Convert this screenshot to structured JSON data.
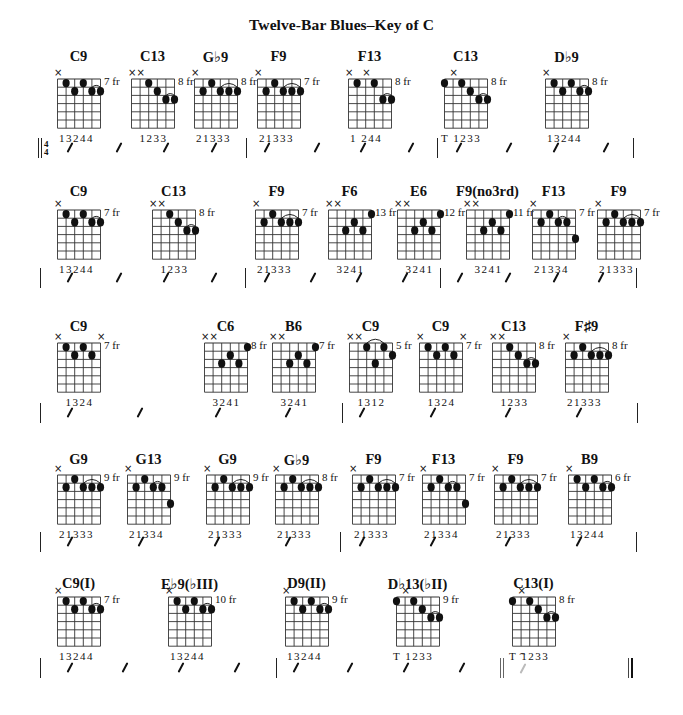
{
  "title": "Twelve-Bar Blues–Key of C",
  "time_signature": {
    "top": "4",
    "bottom": "4"
  },
  "fermata_symbol": "⌢",
  "rows": [
    {
      "chords": [
        {
          "name": "C9",
          "fret": "7 fr",
          "muted": [
            0
          ],
          "dots": [
            [
              1,
              1
            ],
            [
              2,
              2
            ],
            [
              3,
              1
            ],
            [
              4,
              2
            ],
            [
              5,
              2
            ]
          ],
          "barres": [
            [
              4,
              5
            ]
          ],
          "fingering": "13244"
        },
        {
          "name": "C13",
          "fret": "8 fr",
          "muted": [
            0,
            1
          ],
          "dots": [
            [
              2,
              1
            ],
            [
              3,
              2
            ],
            [
              4,
              3
            ],
            [
              5,
              3
            ]
          ],
          "barres": [
            [
              4,
              5
            ]
          ],
          "fingering": "1233"
        },
        {
          "name": "G♭9",
          "fret": "8 fr",
          "muted": [
            0
          ],
          "dots": [
            [
              1,
              2
            ],
            [
              2,
              1
            ],
            [
              3,
              2
            ],
            [
              4,
              2
            ],
            [
              5,
              2
            ]
          ],
          "barres": [
            [
              3,
              5
            ]
          ],
          "fingering": "21333"
        },
        {
          "name": "F9",
          "fret": "7 fr",
          "muted": [
            0
          ],
          "dots": [
            [
              1,
              2
            ],
            [
              2,
              1
            ],
            [
              3,
              2
            ],
            [
              4,
              2
            ],
            [
              5,
              2
            ]
          ],
          "barres": [
            [
              3,
              5
            ]
          ],
          "fingering": "21333"
        },
        {
          "name": "F13",
          "fret": "8 fr",
          "muted": [
            0,
            2
          ],
          "dots": [
            [
              1,
              1
            ],
            [
              3,
              1
            ],
            [
              4,
              3
            ],
            [
              5,
              3
            ]
          ],
          "barres": [
            [
              4,
              5
            ]
          ],
          "fingering": "1  244"
        },
        {
          "name": "C13",
          "fret": "8 fr",
          "muted": [
            1
          ],
          "dots": [
            [
              0,
              1
            ],
            [
              2,
              1
            ],
            [
              3,
              2
            ],
            [
              4,
              3
            ],
            [
              5,
              3
            ]
          ],
          "barres": [
            [
              4,
              5
            ]
          ],
          "fingering": "T 1233"
        },
        {
          "name": "D♭9",
          "fret": "8 fr",
          "muted": [
            0
          ],
          "dots": [
            [
              1,
              1
            ],
            [
              2,
              2
            ],
            [
              3,
              1
            ],
            [
              4,
              2
            ],
            [
              5,
              2
            ]
          ],
          "barres": [
            [
              4,
              5
            ]
          ],
          "fingering": "13244"
        }
      ]
    },
    {
      "chords": [
        {
          "name": "C9",
          "fret": "7 fr",
          "muted": [
            0
          ],
          "dots": [
            [
              1,
              1
            ],
            [
              2,
              2
            ],
            [
              3,
              1
            ],
            [
              4,
              2
            ],
            [
              5,
              2
            ]
          ],
          "barres": [
            [
              4,
              5
            ]
          ],
          "fingering": "13244"
        },
        {
          "name": "C13",
          "fret": "8 fr",
          "muted": [
            0,
            1
          ],
          "dots": [
            [
              2,
              1
            ],
            [
              3,
              2
            ],
            [
              4,
              3
            ],
            [
              5,
              3
            ]
          ],
          "barres": [
            [
              4,
              5
            ]
          ],
          "fingering": "1233"
        },
        {
          "name": "F9",
          "fret": "7 fr",
          "muted": [
            0
          ],
          "dots": [
            [
              1,
              2
            ],
            [
              2,
              1
            ],
            [
              3,
              2
            ],
            [
              4,
              2
            ],
            [
              5,
              2
            ]
          ],
          "barres": [
            [
              3,
              5
            ]
          ],
          "fingering": "21333"
        },
        {
          "name": "F6",
          "fret": "13 fr",
          "muted": [
            0,
            1
          ],
          "dots": [
            [
              2,
              3
            ],
            [
              3,
              2
            ],
            [
              4,
              3
            ],
            [
              5,
              1
            ]
          ],
          "barres": [],
          "fingering": "3241"
        },
        {
          "name": "E6",
          "fret": "12 fr",
          "muted": [
            0,
            1
          ],
          "dots": [
            [
              2,
              3
            ],
            [
              3,
              2
            ],
            [
              4,
              3
            ],
            [
              5,
              1
            ]
          ],
          "barres": [],
          "fingering": "3241"
        },
        {
          "name": "F9(no3rd)",
          "fret": "11 fr",
          "muted": [
            0,
            1
          ],
          "dots": [
            [
              2,
              3
            ],
            [
              3,
              2
            ],
            [
              4,
              3
            ],
            [
              5,
              1
            ]
          ],
          "barres": [],
          "fingering": "3241"
        },
        {
          "name": "F13",
          "fret": "7 fr",
          "muted": [
            0
          ],
          "dots": [
            [
              1,
              2
            ],
            [
              2,
              1
            ],
            [
              3,
              2
            ],
            [
              4,
              2
            ],
            [
              5,
              4
            ]
          ],
          "barres": [
            [
              3,
              4
            ]
          ],
          "fingering": "21334"
        },
        {
          "name": "F9",
          "fret": "7 fr",
          "muted": [
            0
          ],
          "dots": [
            [
              1,
              2
            ],
            [
              2,
              1
            ],
            [
              3,
              2
            ],
            [
              4,
              2
            ],
            [
              5,
              2
            ]
          ],
          "barres": [
            [
              3,
              5
            ]
          ],
          "fingering": "21333"
        }
      ]
    },
    {
      "chords": [
        {
          "name": "C9",
          "fret": "7 fr",
          "muted": [
            0,
            5
          ],
          "dots": [
            [
              1,
              1
            ],
            [
              2,
              2
            ],
            [
              3,
              1
            ],
            [
              4,
              2
            ]
          ],
          "barres": [],
          "fingering": "1324"
        },
        {
          "name": "C6",
          "fret": "8 fr",
          "muted": [
            0,
            1
          ],
          "dots": [
            [
              2,
              3
            ],
            [
              3,
              2
            ],
            [
              4,
              3
            ],
            [
              5,
              1
            ]
          ],
          "barres": [],
          "fingering": "3241"
        },
        {
          "name": "B6",
          "fret": "7 fr",
          "muted": [
            0,
            1
          ],
          "dots": [
            [
              2,
              3
            ],
            [
              3,
              2
            ],
            [
              4,
              3
            ],
            [
              5,
              1
            ]
          ],
          "barres": [],
          "fingering": "3241"
        },
        {
          "name": "C9",
          "fret": "5 fr",
          "muted": [
            0,
            1
          ],
          "dots": [
            [
              2,
              1
            ],
            [
              3,
              3
            ],
            [
              4,
              1
            ],
            [
              5,
              2
            ]
          ],
          "barres": [
            [
              2,
              4
            ]
          ],
          "fingering": "1312"
        },
        {
          "name": "C9",
          "fret": "7 fr",
          "muted": [
            0,
            5
          ],
          "dots": [
            [
              1,
              1
            ],
            [
              2,
              2
            ],
            [
              3,
              1
            ],
            [
              4,
              2
            ]
          ],
          "barres": [],
          "fingering": "1324"
        },
        {
          "name": "C13",
          "fret": "8 fr",
          "muted": [
            0,
            1
          ],
          "dots": [
            [
              2,
              1
            ],
            [
              3,
              2
            ],
            [
              4,
              3
            ],
            [
              5,
              3
            ]
          ],
          "barres": [
            [
              4,
              5
            ]
          ],
          "fingering": "1233"
        },
        {
          "name": "F♯9",
          "fret": "8 fr",
          "muted": [
            0
          ],
          "dots": [
            [
              1,
              2
            ],
            [
              2,
              1
            ],
            [
              3,
              2
            ],
            [
              4,
              2
            ],
            [
              5,
              2
            ]
          ],
          "barres": [
            [
              3,
              5
            ]
          ],
          "fingering": "21333"
        }
      ]
    },
    {
      "chords": [
        {
          "name": "G9",
          "fret": "9 fr",
          "muted": [
            0
          ],
          "dots": [
            [
              1,
              2
            ],
            [
              2,
              1
            ],
            [
              3,
              2
            ],
            [
              4,
              2
            ],
            [
              5,
              2
            ]
          ],
          "barres": [
            [
              3,
              5
            ]
          ],
          "fingering": "21333"
        },
        {
          "name": "G13",
          "fret": "9 fr",
          "muted": [
            0
          ],
          "dots": [
            [
              1,
              2
            ],
            [
              2,
              1
            ],
            [
              3,
              2
            ],
            [
              4,
              2
            ],
            [
              5,
              4
            ]
          ],
          "barres": [
            [
              3,
              4
            ]
          ],
          "fingering": "21334"
        },
        {
          "name": "G9",
          "fret": "9 fr",
          "muted": [
            0
          ],
          "dots": [
            [
              1,
              2
            ],
            [
              2,
              1
            ],
            [
              3,
              2
            ],
            [
              4,
              2
            ],
            [
              5,
              2
            ]
          ],
          "barres": [
            [
              3,
              5
            ]
          ],
          "fingering": "21333"
        },
        {
          "name": "G♭9",
          "fret": "8 fr",
          "muted": [
            0
          ],
          "dots": [
            [
              1,
              2
            ],
            [
              2,
              1
            ],
            [
              3,
              2
            ],
            [
              4,
              2
            ],
            [
              5,
              2
            ]
          ],
          "barres": [
            [
              3,
              5
            ]
          ],
          "fingering": "21333"
        },
        {
          "name": "F9",
          "fret": "7 fr",
          "muted": [
            0
          ],
          "dots": [
            [
              1,
              2
            ],
            [
              2,
              1
            ],
            [
              3,
              2
            ],
            [
              4,
              2
            ],
            [
              5,
              2
            ]
          ],
          "barres": [
            [
              3,
              5
            ]
          ],
          "fingering": "21333"
        },
        {
          "name": "F13",
          "fret": "7 fr",
          "muted": [
            0
          ],
          "dots": [
            [
              1,
              2
            ],
            [
              2,
              1
            ],
            [
              3,
              2
            ],
            [
              4,
              2
            ],
            [
              5,
              4
            ]
          ],
          "barres": [
            [
              3,
              4
            ]
          ],
          "fingering": "21334"
        },
        {
          "name": "F9",
          "fret": "7 fr",
          "muted": [
            0
          ],
          "dots": [
            [
              1,
              2
            ],
            [
              2,
              1
            ],
            [
              3,
              2
            ],
            [
              4,
              2
            ],
            [
              5,
              2
            ]
          ],
          "barres": [
            [
              3,
              5
            ]
          ],
          "fingering": "21333"
        },
        {
          "name": "B9",
          "fret": "6 fr",
          "muted": [
            0
          ],
          "dots": [
            [
              1,
              1
            ],
            [
              2,
              2
            ],
            [
              3,
              1
            ],
            [
              4,
              2
            ],
            [
              5,
              2
            ]
          ],
          "barres": [
            [
              4,
              5
            ]
          ],
          "fingering": "13244"
        }
      ]
    },
    {
      "chords": [
        {
          "name": "C9(I)",
          "fret": "7 fr",
          "muted": [
            0
          ],
          "dots": [
            [
              1,
              1
            ],
            [
              2,
              2
            ],
            [
              3,
              1
            ],
            [
              4,
              2
            ],
            [
              5,
              2
            ]
          ],
          "barres": [
            [
              4,
              5
            ]
          ],
          "fingering": "13244"
        },
        {
          "name": "E♭9(♭III)",
          "fret": "10 fr",
          "muted": [
            0
          ],
          "dots": [
            [
              1,
              1
            ],
            [
              2,
              2
            ],
            [
              3,
              1
            ],
            [
              4,
              2
            ],
            [
              5,
              2
            ]
          ],
          "barres": [
            [
              4,
              5
            ]
          ],
          "fingering": "13244"
        },
        {
          "name": "D9(II)",
          "fret": "9 fr",
          "muted": [
            0
          ],
          "dots": [
            [
              1,
              1
            ],
            [
              2,
              2
            ],
            [
              3,
              1
            ],
            [
              4,
              2
            ],
            [
              5,
              2
            ]
          ],
          "barres": [
            [
              4,
              5
            ]
          ],
          "fingering": "13244"
        },
        {
          "name": "D♭13(♭II)",
          "fret": "9 fr",
          "muted": [
            1
          ],
          "dots": [
            [
              0,
              1
            ],
            [
              2,
              1
            ],
            [
              3,
              2
            ],
            [
              4,
              3
            ],
            [
              5,
              3
            ]
          ],
          "barres": [
            [
              4,
              5
            ]
          ],
          "fingering": "T 1233"
        },
        {
          "name": "C13(I)",
          "fret": "8 fr",
          "muted": [
            1
          ],
          "dots": [
            [
              0,
              1
            ],
            [
              2,
              1
            ],
            [
              3,
              2
            ],
            [
              4,
              3
            ],
            [
              5,
              3
            ]
          ],
          "barres": [
            [
              4,
              5
            ]
          ],
          "fingering": "T 1233"
        }
      ]
    }
  ]
}
